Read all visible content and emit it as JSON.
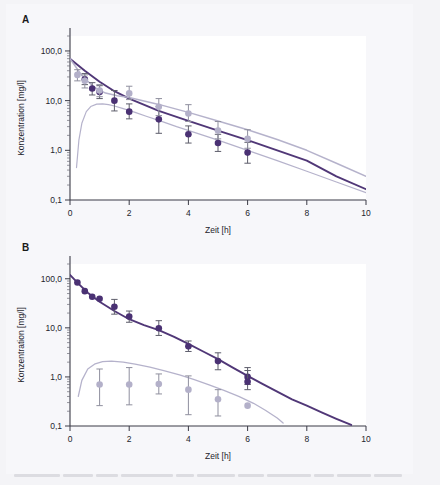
{
  "figure": {
    "background_color": "#f4f4f7",
    "sheet_color": "#f7f7fa",
    "series_colors": {
      "dark_purple": "#4a3173",
      "light_lavender": "#b3b0c9",
      "axis": "#3b3b46"
    }
  },
  "panels": [
    {
      "letter": "A",
      "chart_data": {
        "type": "scatter",
        "title": "",
        "xlabel": "Zeit [h]",
        "ylabel": "Konzentration [mg/l]",
        "xlim": [
          0,
          10
        ],
        "ylim": [
          0.1,
          200
        ],
        "yscale": "log",
        "xticks": [
          0,
          2,
          4,
          6,
          8,
          10
        ],
        "xticklabels": [
          "0",
          "2",
          "4",
          "6",
          "8",
          "10"
        ],
        "yticks": [
          0.1,
          1.0,
          10.0,
          100.0
        ],
        "yticklabels": [
          "0,1",
          "1,0",
          "10,0",
          "100,0"
        ],
        "grid": false,
        "legend": "none",
        "series": [
          {
            "name": "dark-purple-observed",
            "color": "#4a3173",
            "marker": "circle",
            "x": [
              0.5,
              0.75,
              1.0,
              1.5,
              2.0,
              3.0,
              4.0,
              5.0,
              6.0
            ],
            "y": [
              27.0,
              17.5,
              15.0,
              10.0,
              6.0,
              4.2,
              2.1,
              1.4,
              0.9
            ],
            "yerr_low": [
              21.0,
              13.0,
              11.0,
              6.2,
              4.3,
              2.2,
              1.4,
              0.95,
              0.55
            ],
            "yerr_high": [
              35.0,
              23.0,
              20.0,
              16.0,
              8.6,
              7.6,
              3.1,
              2.1,
              1.45
            ]
          },
          {
            "name": "light-lavender-observed",
            "color": "#b3b0c9",
            "marker": "circle",
            "x": [
              0.25,
              0.5,
              1.0,
              2.0,
              3.0,
              4.0,
              5.0,
              6.0
            ],
            "y": [
              33.0,
              25.0,
              16.0,
              14.0,
              7.5,
              5.5,
              2.5,
              1.7
            ],
            "yerr_low": [
              25.0,
              18.0,
              12.0,
              10.5,
              5.0,
              3.8,
              1.7,
              1.1
            ],
            "yerr_high": [
              42.0,
              33.0,
              21.0,
              19.5,
              11.0,
              8.3,
              3.8,
              2.6
            ]
          }
        ],
        "curves": [
          {
            "name": "dark-purple-fit",
            "color": "#4a3173",
            "style": "solid",
            "width": 1.9,
            "points": [
              [
                0,
                70
              ],
              [
                0.5,
                40
              ],
              [
                1,
                24
              ],
              [
                1.5,
                15.5
              ],
              [
                2,
                11.0
              ],
              [
                3,
                6.2
              ],
              [
                4,
                3.9
              ],
              [
                5,
                2.5
              ],
              [
                6,
                1.6
              ],
              [
                7,
                1.0
              ],
              [
                8,
                0.62
              ],
              [
                9,
                0.3
              ],
              [
                10,
                0.165
              ]
            ]
          },
          {
            "name": "light-lavender-fit",
            "color": "#b3b0c9",
            "style": "solid",
            "width": 1.5,
            "points": [
              [
                0,
                70
              ],
              [
                0.4,
                32
              ],
              [
                0.8,
                19
              ],
              [
                1.2,
                14.2
              ],
              [
                1.6,
                12.6
              ],
              [
                2,
                11.6
              ],
              [
                3,
                8.4
              ],
              [
                4,
                5.8
              ],
              [
                5,
                3.9
              ],
              [
                6,
                2.6
              ],
              [
                7,
                1.65
              ],
              [
                8,
                1.0
              ],
              [
                9,
                0.55
              ],
              [
                10,
                0.3
              ]
            ]
          },
          {
            "name": "light-lavender-absorption",
            "color": "#b3b0c9",
            "style": "solid",
            "width": 1.2,
            "points": [
              [
                0.22,
                0.45
              ],
              [
                0.3,
                1.6
              ],
              [
                0.4,
                3.5
              ],
              [
                0.55,
                6.0
              ],
              [
                0.7,
                7.6
              ],
              [
                0.9,
                8.5
              ],
              [
                1.1,
                8.6
              ],
              [
                1.3,
                8.3
              ],
              [
                1.5,
                7.8
              ],
              [
                1.8,
                6.9
              ],
              [
                2.2,
                5.8
              ],
              [
                2.6,
                4.8
              ],
              [
                3.0,
                4.0
              ],
              [
                3.6,
                3.0
              ],
              [
                4.2,
                2.3
              ],
              [
                5.0,
                1.6
              ],
              [
                6.0,
                1.0
              ],
              [
                7.0,
                0.62
              ],
              [
                8.0,
                0.38
              ],
              [
                9.0,
                0.23
              ],
              [
                10,
                0.14
              ]
            ]
          }
        ]
      }
    },
    {
      "letter": "B",
      "chart_data": {
        "type": "scatter",
        "title": "",
        "xlabel": "Zeit [h]",
        "ylabel": "Konzentration [mg/l]",
        "xlim": [
          0,
          10
        ],
        "ylim": [
          0.1,
          200
        ],
        "yscale": "log",
        "xticks": [
          0,
          2,
          4,
          6,
          8,
          10
        ],
        "xticklabels": [
          "0",
          "2",
          "4",
          "6",
          "8",
          "10"
        ],
        "yticks": [
          0.1,
          1.0,
          10.0,
          100.0
        ],
        "yticklabels": [
          "0,1",
          "1,0",
          "10,0",
          "100,0"
        ],
        "grid": false,
        "legend": "none",
        "series": [
          {
            "name": "dark-purple-observed",
            "color": "#4a3173",
            "marker": "circle",
            "x": [
              0.25,
              0.5,
              0.75,
              1.0,
              1.5,
              2.0,
              3.0,
              4.0,
              5.0,
              6.0
            ],
            "y": [
              84.0,
              56.0,
              43.0,
              39.0,
              27.0,
              17.0,
              9.8,
              4.2,
              2.1,
              1.0
            ],
            "yerr_low": [
              84.0,
              56.0,
              43.0,
              39.0,
              19.0,
              13.0,
              7.0,
              3.3,
              1.4,
              0.7
            ],
            "yerr_high": [
              84.0,
              56.0,
              43.0,
              39.0,
              38.0,
              22.0,
              14.0,
              5.4,
              3.1,
              1.55
            ]
          },
          {
            "name": "dark-purple-observed-late",
            "color": "#4a3173",
            "marker": "circle",
            "x": [
              6.0
            ],
            "y": [
              0.8
            ],
            "yerr_low": [
              0.55
            ],
            "yerr_high": [
              1.35
            ]
          },
          {
            "name": "light-lavender-observed",
            "color": "#b3b0c9",
            "marker": "circle",
            "x": [
              1.0,
              2.0,
              3.0,
              4.0,
              5.0,
              6.0
            ],
            "y": [
              0.7,
              0.7,
              0.72,
              0.55,
              0.35,
              0.26
            ],
            "yerr_low": [
              0.26,
              0.27,
              0.45,
              0.17,
              0.16,
              0.26
            ],
            "yerr_high": [
              1.45,
              1.55,
              1.15,
              1.05,
              0.55,
              0.26
            ]
          }
        ],
        "curves": [
          {
            "name": "dark-purple-fit",
            "color": "#4a3173",
            "style": "solid",
            "width": 1.9,
            "points": [
              [
                0,
                120
              ],
              [
                0.3,
                78
              ],
              [
                0.6,
                52
              ],
              [
                1.0,
                34
              ],
              [
                1.5,
                22
              ],
              [
                2.0,
                15.0
              ],
              [
                2.5,
                11.4
              ],
              [
                3.0,
                9.0
              ],
              [
                3.5,
                6.6
              ],
              [
                4.0,
                4.7
              ],
              [
                4.5,
                3.3
              ],
              [
                5.0,
                2.3
              ],
              [
                5.5,
                1.55
              ],
              [
                6.0,
                1.05
              ],
              [
                6.5,
                0.72
              ],
              [
                7.0,
                0.5
              ],
              [
                7.5,
                0.35
              ],
              [
                8.0,
                0.26
              ],
              [
                8.5,
                0.19
              ],
              [
                9.0,
                0.14
              ],
              [
                9.5,
                0.105
              ]
            ]
          },
          {
            "name": "light-lavender-absorption",
            "color": "#b3b0c9",
            "style": "solid",
            "width": 1.3,
            "points": [
              [
                0.28,
                0.4
              ],
              [
                0.4,
                0.85
              ],
              [
                0.6,
                1.45
              ],
              [
                0.85,
                1.85
              ],
              [
                1.1,
                2.05
              ],
              [
                1.4,
                2.1
              ],
              [
                1.8,
                2.0
              ],
              [
                2.2,
                1.83
              ],
              [
                2.7,
                1.58
              ],
              [
                3.2,
                1.33
              ],
              [
                3.7,
                1.1
              ],
              [
                4.2,
                0.88
              ],
              [
                4.7,
                0.69
              ],
              [
                5.2,
                0.53
              ],
              [
                5.7,
                0.4
              ],
              [
                6.2,
                0.29
              ],
              [
                6.6,
                0.21
              ],
              [
                7.0,
                0.145
              ],
              [
                7.2,
                0.115
              ]
            ]
          }
        ]
      }
    }
  ]
}
